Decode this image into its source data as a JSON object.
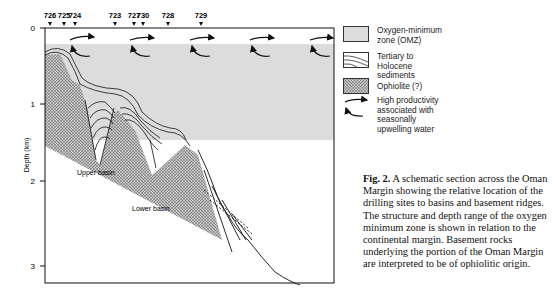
{
  "figure": {
    "sites": [
      {
        "label": "726",
        "x": 50
      },
      {
        "label": "725",
        "x": 64
      },
      {
        "label": "724",
        "x": 75
      },
      {
        "label": "723",
        "x": 115
      },
      {
        "label": "727",
        "x": 134
      },
      {
        "label": "730",
        "x": 143
      },
      {
        "label": "728",
        "x": 168
      },
      {
        "label": "729",
        "x": 201
      }
    ],
    "y_axis": {
      "label": "Depth (km)",
      "ticks": [
        {
          "label": "0",
          "y": 28
        },
        {
          "label": "1",
          "y": 104
        },
        {
          "label": "2",
          "y": 181
        },
        {
          "label": "3",
          "y": 266
        }
      ]
    },
    "annotations": {
      "upper_basin": "Upper basin",
      "lower_basin": "Lower basin"
    },
    "colors": {
      "omz": "#dcdcdc",
      "ophiolite": "#9a9a9a",
      "line": "#111111"
    }
  },
  "legend": {
    "items": [
      {
        "label": "Oxygen-minimum zone (OMZ)"
      },
      {
        "label": "Tertiary to Holocene sediments"
      },
      {
        "label": "Ophiolite (?)"
      },
      {
        "label": "High productivity associated with seasonally upwelling water"
      }
    ]
  },
  "caption": {
    "label": "Fig. 2.",
    "text": " A schematic section across the Oman Margin showing the relative location of the drilling sites to basins and basement ridges. The structure and depth range of the oxygen minimum zone is shown in relation to the continental margin. Basement rocks underlying the portion of the Oman Margin are interpreted to be of ophiolitic origin."
  }
}
